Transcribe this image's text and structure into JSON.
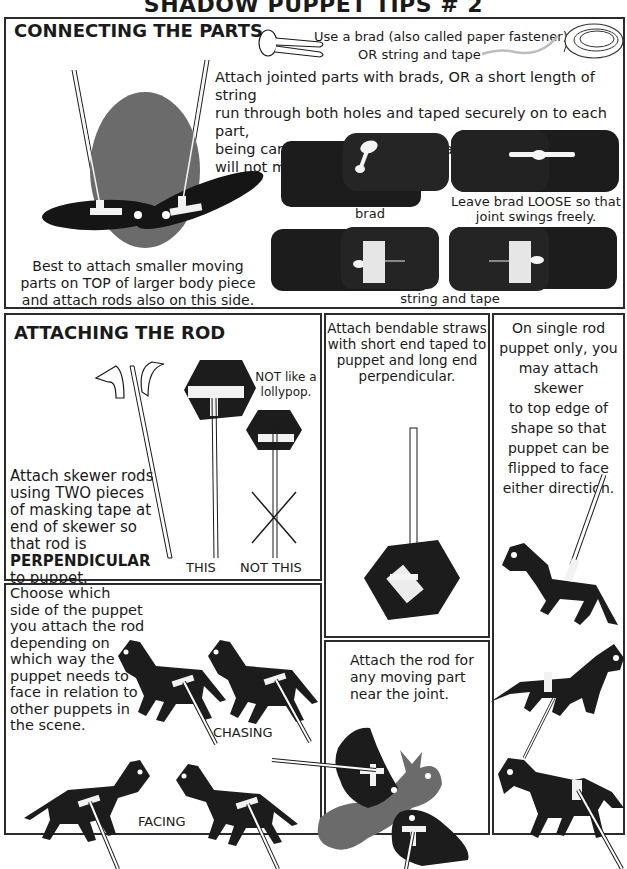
{
  "page_title": "SHADOW PUPPET TIPS # 2",
  "colors": {
    "ink": "#1a1a1a",
    "silhouette": "#1c1c1c",
    "gray_piece": "#6e6e6e",
    "tape": "#f2f2f2",
    "border": "#2b2b2b",
    "background": "#ffffff"
  },
  "connecting": {
    "heading": "CONNECTING THE PARTS",
    "brad_note": "Use a brad (also called paper fastener)",
    "string_note": "OR string and tape",
    "instructions": [
      "Attach jointed parts with brads, OR a short length of string",
      "run through both holes and taped securely on to each part,",
      "being careful NOT to tape the parts together, or they will not move."
    ],
    "left_caption": [
      "Best to attach smaller moving",
      "parts on TOP of larger body piece",
      "and attach rods also on this side."
    ],
    "brad_label": "brad",
    "loose_label": [
      "Leave brad LOOSE so that",
      "joint swings freely."
    ],
    "string_tape_label": "string and tape"
  },
  "attaching_rod": {
    "heading": "ATTACHING THE ROD",
    "lollypop_note": [
      "NOT like a",
      "lollypop."
    ],
    "instructions": [
      "Attach skewer rods",
      "using TWO pieces",
      "of masking tape at",
      "end of skewer so",
      "that rod is"
    ],
    "emphasis": "PERPENDICULAR",
    "instructions_end": "to puppet.",
    "this_label": "THIS",
    "not_this_label": "NOT THIS"
  },
  "straws": {
    "instructions": [
      "Attach bendable straws",
      "with short end taped to",
      "puppet and  long end",
      "perpendicular."
    ]
  },
  "single_rod": {
    "instructions": [
      "On single rod",
      "puppet only, you",
      "may attach skewer",
      "to top edge of",
      "shape so that",
      "puppet can be",
      "flipped to face",
      "either direction."
    ]
  },
  "choose_side": {
    "instructions": [
      "Choose which",
      "side of the puppet",
      "you attach the rod",
      "depending on",
      "which way the",
      "puppet needs to",
      "face in relation to",
      "other puppets in",
      "the scene."
    ],
    "chasing_label": "CHASING",
    "facing_label": "FACING"
  },
  "moving_part": {
    "instructions": [
      "Attach the rod for",
      "any moving part",
      "near the joint."
    ]
  }
}
